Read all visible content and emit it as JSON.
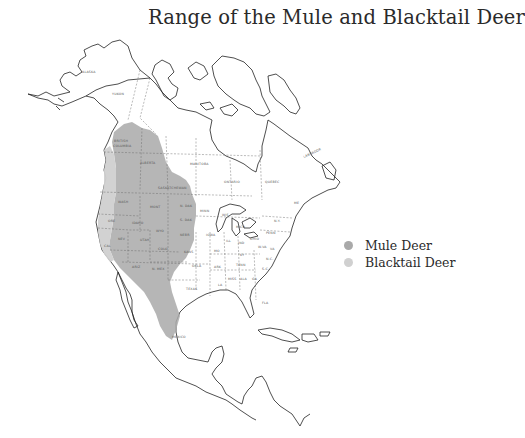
{
  "title": "Range of the Mule and Blacktail Deer",
  "legend": {
    "items": [
      {
        "label": "Mule Deer",
        "color": "#a9a9a9"
      },
      {
        "label": "Blacktail Deer",
        "color": "#d0d0d0"
      }
    ]
  },
  "map": {
    "region": "North America",
    "labels": {
      "alaska": "ALASKA",
      "yukon": "YUKON",
      "british_columbia_1": "BRITISH",
      "british_columbia_2": "COLUMBIA",
      "alberta": "ALBERTA",
      "saskatchewan": "SASKATCHEWAN",
      "manitoba": "MANITOBA",
      "ontario": "ONTARIO",
      "quebec": "QUEBEC",
      "labrador": "LABRADOR",
      "wash": "WASH",
      "ore": "ORE",
      "idaho": "IDAHO",
      "mont": "MONT",
      "wyo": "WYO",
      "n_dak": "N. DAK",
      "s_dak": "S. DAK",
      "nebr": "NEBR",
      "kans": "KANS",
      "okla": "OKLA",
      "texas": "TEXAS",
      "calif": "CAL",
      "nev": "NEV",
      "utah": "UTAH",
      "colo": "COLO",
      "ariz": "ARIZ",
      "n_mex": "N. MEX",
      "minn": "MINN",
      "iowa": "IOWA",
      "mo": "MO",
      "ark": "ARK",
      "la": "LA",
      "wis": "WIS",
      "ill": "ILL",
      "mich": "MICH",
      "ind": "IND",
      "ohio": "OHIO",
      "ky": "KY",
      "tenn": "TENN",
      "miss": "MISS",
      "ala": "ALA",
      "ga": "GA",
      "fla": "FLA",
      "sc": "S.C.",
      "nc": "N.C.",
      "va": "VA",
      "wva": "W.VA",
      "penn": "PENN",
      "ny": "N.Y.",
      "me": "ME",
      "mexico": "MEXICO"
    }
  }
}
